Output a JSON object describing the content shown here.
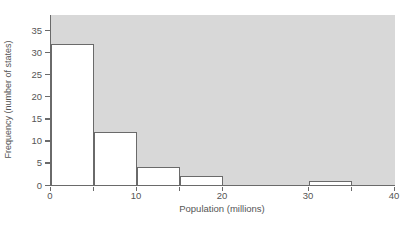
{
  "chart_data": {
    "type": "bar",
    "subtype": "histogram",
    "title": "",
    "xlabel": "Population (millions)",
    "ylabel": "Frequency (number of states)",
    "bin_edges": [
      0,
      5,
      10,
      15,
      20,
      25,
      30,
      35,
      40
    ],
    "frequencies": [
      32,
      12,
      4,
      2,
      0,
      0,
      1,
      0
    ],
    "xlim": [
      0,
      40
    ],
    "ylim": [
      0,
      38.5
    ],
    "yticks": [
      0,
      5,
      10,
      15,
      20,
      25,
      30,
      35
    ],
    "xtick_labels": [
      0,
      10,
      20,
      30,
      40
    ],
    "xtick_marks": [
      0,
      5,
      10,
      15,
      20,
      30,
      35,
      40
    ],
    "grid": false,
    "legend": "none",
    "colors": {
      "figure_background": "#ffffff",
      "plot_background": "#d8d8d8",
      "bar_fill": "#ffffff",
      "bar_border": "#6a6a6a",
      "axis": "#6a6a6a",
      "tick_text": "#555555"
    }
  }
}
